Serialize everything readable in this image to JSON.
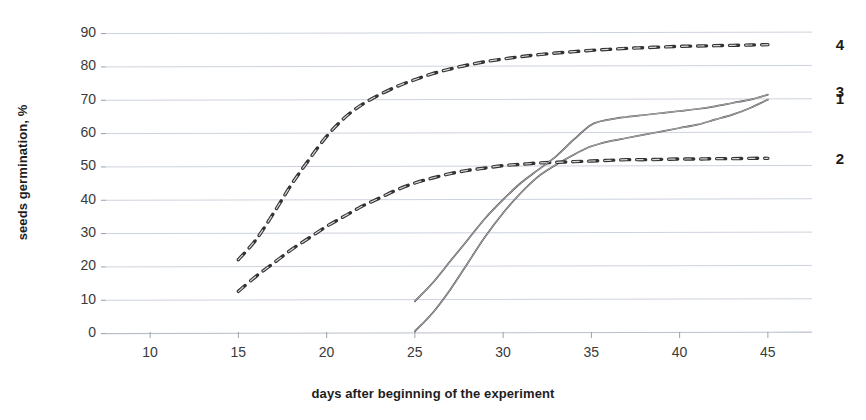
{
  "chart_data": {
    "type": "line",
    "title": "",
    "xlabel": "days after beginning of the experiment",
    "ylabel": "seeds germination, %",
    "xlim": [
      7.5,
      47.5
    ],
    "ylim": [
      0,
      90
    ],
    "xticks": [
      10,
      15,
      20,
      25,
      30,
      35,
      40,
      45
    ],
    "yticks": [
      0,
      10,
      20,
      30,
      40,
      50,
      60,
      70,
      80,
      90
    ],
    "grid": true,
    "legend": "right-edge-series-numbers",
    "series": [
      {
        "name": "1",
        "style": "solid",
        "label": "1",
        "label_y": 70,
        "x": [
          25,
          26,
          27,
          28,
          29,
          30,
          31,
          32,
          33,
          34,
          35,
          36,
          37,
          38,
          39,
          40,
          41,
          42,
          43,
          44,
          45
        ],
        "values": [
          0.5,
          6,
          13,
          21,
          29,
          36,
          42,
          47,
          50.5,
          53.5,
          56,
          57.5,
          58.5,
          59.5,
          60.5,
          61.5,
          62.5,
          64,
          65.5,
          67.5,
          70
        ]
      },
      {
        "name": "2",
        "style": "dashed",
        "label": "2",
        "label_y": 52,
        "x": [
          15,
          16,
          17,
          18,
          19,
          20,
          21,
          22,
          23,
          24,
          25,
          26,
          27,
          28,
          29,
          30,
          31,
          32,
          33,
          34,
          35,
          36,
          37,
          38,
          39,
          40,
          41,
          42,
          43,
          44,
          45
        ],
        "values": [
          12.5,
          17,
          21,
          25,
          28.5,
          32,
          35,
          38,
          40.5,
          43,
          45,
          46.5,
          47.8,
          48.8,
          49.5,
          50.2,
          50.6,
          51,
          51.2,
          51.4,
          51.6,
          51.8,
          52,
          52,
          52.1,
          52.2,
          52.2,
          52.3,
          52.3,
          52.4,
          52.4
        ]
      },
      {
        "name": "3",
        "style": "solid",
        "label": "3",
        "label_y": 72,
        "x": [
          25,
          26,
          27,
          28,
          29,
          30,
          31,
          32,
          33,
          34,
          35,
          36,
          37,
          38,
          39,
          40,
          41,
          42,
          43,
          44,
          45
        ],
        "values": [
          9.5,
          15,
          21.5,
          28,
          34.5,
          40,
          45,
          49,
          53,
          58,
          62.5,
          64,
          64.8,
          65.4,
          66,
          66.6,
          67.2,
          68,
          69,
          70,
          71.5
        ]
      },
      {
        "name": "4",
        "style": "dashed",
        "label": "4",
        "label_y": 86,
        "x": [
          15,
          16,
          17,
          18,
          19,
          20,
          21,
          22,
          23,
          24,
          25,
          26,
          27,
          28,
          29,
          30,
          31,
          32,
          33,
          34,
          35,
          36,
          37,
          38,
          39,
          40,
          41,
          42,
          43,
          44,
          45
        ],
        "values": [
          22,
          28,
          36,
          44.5,
          52,
          59,
          64.5,
          68.5,
          71.5,
          74,
          76,
          77.8,
          79.2,
          80.4,
          81.4,
          82.2,
          82.9,
          83.5,
          84,
          84.4,
          84.8,
          85.1,
          85.4,
          85.6,
          85.8,
          86,
          86.1,
          86.2,
          86.3,
          86.4,
          86.5
        ]
      }
    ]
  },
  "axes": {
    "y_title": "seeds germination, %",
    "x_title": "days after beginning of the experiment",
    "y_tick_labels": [
      "90",
      "80",
      "70",
      "60",
      "50",
      "40",
      "30",
      "20",
      "10",
      "0"
    ],
    "x_tick_labels": [
      "10",
      "15",
      "20",
      "25",
      "30",
      "35",
      "40",
      "45"
    ]
  },
  "colors": {
    "background": "#ffffff",
    "grid": "#cdd3dd",
    "axis": "#b9bfc9",
    "curve": "#4a4a4a",
    "dashed_curve": "#333333",
    "text": "#2b2b2b"
  }
}
